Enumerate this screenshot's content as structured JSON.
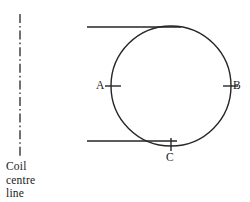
{
  "diagram": {
    "name": "coil-cross-section-diagram",
    "stroke_color": "#262626",
    "background_color": "#ffffff",
    "centre_line": {
      "icon": "dash-dot-centre-line-icon",
      "x": 20,
      "y_top": 14,
      "y_bottom": 158,
      "pattern": "dash-dot"
    },
    "caption": {
      "lines": [
        "Coil",
        "centre",
        "line"
      ],
      "line1": "Coil",
      "line2": "centre",
      "line3": "line"
    },
    "circle": {
      "center_x": 171,
      "center_y": 86,
      "radius": 60
    },
    "horizontal_lines": [
      {
        "name": "upper-tangent-line",
        "x1": 87,
        "y1": 27,
        "x2": 181,
        "y2": 27
      },
      {
        "name": "lower-tangent-line",
        "x1": 87,
        "y1": 141,
        "x2": 176,
        "y2": 141
      }
    ],
    "points": [
      {
        "id": "A",
        "label": "A",
        "tick": "horizontal",
        "cx": 111,
        "cy": 86
      },
      {
        "id": "B",
        "label": "B",
        "tick": "horizontal",
        "cx": 231,
        "cy": 86
      },
      {
        "id": "C",
        "label": "C",
        "tick": "vertical",
        "cx": 171,
        "cy": 146
      }
    ]
  }
}
